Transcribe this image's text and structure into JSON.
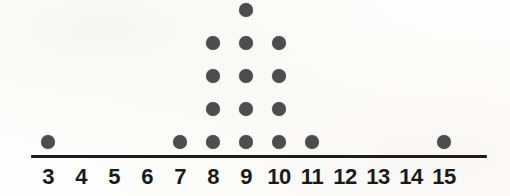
{
  "chart_data": {
    "type": "dotplot",
    "title": "",
    "subtitle": "",
    "xlabel": "",
    "ylabel": "",
    "grid": false,
    "legend": null,
    "xlim": [
      3,
      15
    ],
    "x_tick_labels": [
      "3",
      "4",
      "5",
      "6",
      "7",
      "8",
      "9",
      "10",
      "11",
      "12",
      "13",
      "14",
      "15"
    ],
    "categories": [
      3,
      4,
      5,
      6,
      7,
      8,
      9,
      10,
      11,
      12,
      13,
      14,
      15
    ],
    "values": [
      1,
      0,
      0,
      0,
      1,
      4,
      5,
      4,
      1,
      0,
      0,
      0,
      1
    ],
    "dot_unit": 1,
    "total_count": 17,
    "max_stack": 5,
    "annotations": []
  },
  "style": {
    "dot_color": "#4d4d4d",
    "axis_color": "#1d1d1d",
    "label_color": "#1a1a1a",
    "background_color": "#fefefe"
  },
  "geometry": {
    "axis_left_px": 31,
    "axis_right_px": 487,
    "axis_y_px": 155,
    "first_tick_x_px": 48,
    "tick_spacing_px": 33,
    "dot_diameter_px": 14,
    "row_spacing_px": 33,
    "bottom_row_center_y_px": 142,
    "label_top_px": 166
  }
}
